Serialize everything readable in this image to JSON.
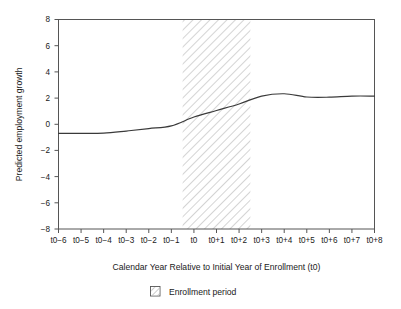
{
  "figure": {
    "background_color": "#ffffff",
    "axis_color": "#555555",
    "line_color": "#3a3a3a",
    "hatch_color": "#b4b4b4"
  },
  "axis_titles": {
    "y": "Predicted employment growth",
    "x": "Calendar Year Relative to Initial Year of Enrollment (t0)"
  },
  "legend": {
    "items": [
      {
        "label": "Enrollment period",
        "swatch": "hatched-square"
      }
    ]
  },
  "chart_data": {
    "type": "line",
    "title": "",
    "xlabel": "Calendar Year Relative to Initial Year of Enrollment (t0)",
    "ylabel": "Predicted employment growth",
    "categories": [
      "t0−6",
      "t0−5",
      "t0−4",
      "t0−3",
      "t0−2",
      "t0−1",
      "t0",
      "t0+1",
      "t0+2",
      "t0+3",
      "t0+4",
      "t0+5",
      "t0+6",
      "t0+7",
      "t0+8"
    ],
    "x": [
      -6,
      -5,
      -4,
      -3,
      -2,
      -1,
      0,
      1,
      2,
      3,
      4,
      5,
      6,
      7,
      8
    ],
    "series": [
      {
        "name": "Predicted employment growth",
        "values": [
          -0.7,
          -0.7,
          -0.68,
          -0.52,
          -0.33,
          -0.12,
          0.55,
          1.05,
          1.55,
          2.15,
          2.33,
          2.08,
          2.07,
          2.15,
          2.15
        ]
      }
    ],
    "ylim": [
      -8,
      8
    ],
    "yticks": [
      8,
      6,
      4,
      2,
      0,
      -2,
      -4,
      -6,
      -8
    ],
    "ytick_labels": [
      "8",
      "6",
      "4",
      "2",
      "0",
      "−2",
      "−4",
      "−6",
      "−8"
    ],
    "xlim": [
      -6,
      8
    ],
    "grid": false,
    "legend_position": "below-axis-centered",
    "annotations": [
      {
        "type": "shaded-band",
        "label": "Enrollment period",
        "x_start": -0.5,
        "x_end": 2.5,
        "fill": "diagonal-hatch"
      }
    ]
  }
}
